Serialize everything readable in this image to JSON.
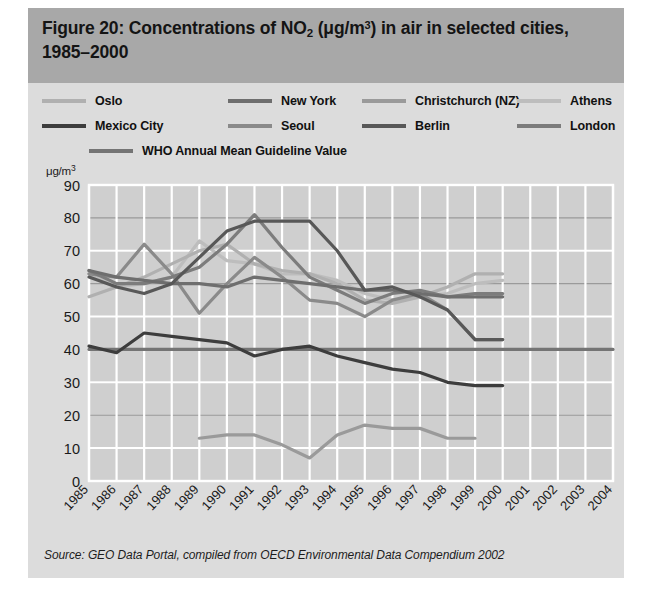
{
  "figure": {
    "title_prefix": "Figure 20: Concentrations of NO",
    "title_sub": "2",
    "title_mid": " (μg/m",
    "title_sup": "3",
    "title_suffix": ") in air in selected cities, 1985–2000",
    "title_plain": "Figure 20: Concentrations of NO2 (μg/m3) in air in selected cities, 1985–2000",
    "source": "Source: GEO Data Portal, compiled from OECD Environmental Data Compendium 2002",
    "y_unit_prefix": "μg/m",
    "y_unit_sup": "3",
    "band_color": "#a8a8a8",
    "panel_color": "#dcdcdc",
    "plot_color": "#cfcfcf"
  },
  "legend": {
    "rows": [
      [
        {
          "label": "Oslo",
          "color": "#b0b0b0",
          "x": 0
        },
        {
          "label": "New York",
          "color": "#6e6e6e",
          "x": 186
        },
        {
          "label": "Christchurch (NZ)",
          "color": "#9a9a9a",
          "x": 320
        },
        {
          "label": "Athens",
          "color": "#bdbdbd",
          "x": 475
        }
      ],
      [
        {
          "label": "Mexico City",
          "color": "#3d3d3d",
          "x": 0
        },
        {
          "label": "Seoul",
          "color": "#8a8a8a",
          "x": 186
        },
        {
          "label": "Berlin",
          "color": "#585858",
          "x": 320
        },
        {
          "label": "London",
          "color": "#7c7c7c",
          "x": 475
        }
      ],
      [
        {
          "label": "WHO Annual Mean Guideline Value",
          "color": "#747474",
          "x": 47
        }
      ]
    ]
  },
  "chart_data": {
    "type": "line",
    "title": "Figure 20: Concentrations of NO2 (μg/m3) in air in selected cities, 1985–2000",
    "xlabel": "",
    "ylabel": "μg/m3",
    "xlim": [
      1985,
      2004
    ],
    "ylim": [
      0,
      90
    ],
    "ytick_step": 10,
    "grid": true,
    "legend_position": "top",
    "x": [
      1985,
      1986,
      1987,
      1988,
      1989,
      1990,
      1991,
      1992,
      1993,
      1994,
      1995,
      1996,
      1997,
      1998,
      1999,
      2000,
      2001,
      2002,
      2003,
      2004
    ],
    "yticks": [
      0,
      10,
      20,
      30,
      40,
      50,
      60,
      70,
      80,
      90
    ],
    "xticklabels": [
      "1985",
      "1986",
      "1987",
      "1988",
      "1989",
      "1990",
      "1991",
      "1992",
      "1993",
      "1994",
      "1995",
      "1996",
      "1997",
      "1998",
      "1999",
      "2000",
      "2001",
      "2002",
      "2003",
      "2004"
    ],
    "series": [
      {
        "name": "Oslo",
        "color": "#b0b0b0",
        "points": [
          [
            1985,
            56
          ],
          [
            1986,
            59
          ],
          [
            1987,
            62
          ],
          [
            1988,
            66
          ],
          [
            1989,
            70
          ],
          [
            1990,
            72
          ],
          [
            1991,
            66
          ],
          [
            1992,
            64
          ],
          [
            1993,
            63
          ],
          [
            1994,
            60
          ],
          [
            1995,
            55
          ],
          [
            1996,
            54
          ],
          [
            1997,
            56
          ],
          [
            1998,
            59
          ],
          [
            1999,
            63
          ],
          [
            2000,
            63
          ]
        ]
      },
      {
        "name": "New York",
        "color": "#6e6e6e",
        "points": [
          [
            1985,
            64
          ],
          [
            1986,
            62
          ],
          [
            1987,
            61
          ],
          [
            1988,
            60
          ],
          [
            1989,
            60
          ],
          [
            1990,
            59
          ],
          [
            1991,
            62
          ],
          [
            1992,
            61
          ],
          [
            1993,
            60
          ],
          [
            1994,
            59
          ],
          [
            1995,
            58
          ],
          [
            1996,
            58
          ],
          [
            1997,
            57
          ],
          [
            1998,
            56
          ],
          [
            1999,
            56
          ],
          [
            2000,
            56
          ]
        ]
      },
      {
        "name": "Christchurch (NZ)",
        "color": "#9a9a9a",
        "points": [
          [
            1989,
            13
          ],
          [
            1990,
            14
          ],
          [
            1991,
            14
          ],
          [
            1992,
            11
          ],
          [
            1993,
            7
          ],
          [
            1994,
            14
          ],
          [
            1995,
            17
          ],
          [
            1996,
            16
          ],
          [
            1997,
            16
          ],
          [
            1998,
            13
          ],
          [
            1999,
            13
          ]
        ]
      },
      {
        "name": "Athens",
        "color": "#bdbdbd",
        "points": [
          [
            1985,
            63
          ],
          [
            1986,
            59
          ],
          [
            1987,
            60
          ],
          [
            1988,
            62
          ],
          [
            1989,
            73
          ],
          [
            1990,
            67
          ],
          [
            1991,
            66
          ],
          [
            1992,
            63
          ],
          [
            1993,
            63
          ],
          [
            1994,
            61
          ],
          [
            1995,
            57
          ],
          [
            1996,
            55
          ],
          [
            1997,
            56
          ],
          [
            1998,
            57
          ],
          [
            1999,
            60
          ],
          [
            2000,
            61
          ]
        ]
      },
      {
        "name": "Mexico City",
        "color": "#3d3d3d",
        "points": [
          [
            1985,
            41
          ],
          [
            1986,
            39
          ],
          [
            1987,
            45
          ],
          [
            1988,
            44
          ],
          [
            1989,
            43
          ],
          [
            1990,
            42
          ],
          [
            1991,
            38
          ],
          [
            1992,
            40
          ],
          [
            1993,
            41
          ],
          [
            1994,
            38
          ],
          [
            1995,
            36
          ],
          [
            1996,
            34
          ],
          [
            1997,
            33
          ],
          [
            1998,
            30
          ],
          [
            1999,
            29
          ],
          [
            2000,
            29
          ]
        ]
      },
      {
        "name": "Seoul",
        "color": "#8a8a8a",
        "points": [
          [
            1985,
            63
          ],
          [
            1986,
            62
          ],
          [
            1987,
            72
          ],
          [
            1988,
            63
          ],
          [
            1989,
            51
          ],
          [
            1990,
            60
          ],
          [
            1991,
            68
          ],
          [
            1992,
            62
          ],
          [
            1993,
            55
          ],
          [
            1994,
            54
          ],
          [
            1995,
            50
          ],
          [
            1996,
            55
          ],
          [
            1997,
            57
          ],
          [
            1998,
            52
          ],
          [
            1999,
            43
          ],
          [
            2000,
            43
          ]
        ]
      },
      {
        "name": "Berlin",
        "color": "#585858",
        "points": [
          [
            1985,
            62
          ],
          [
            1986,
            59
          ],
          [
            1987,
            57
          ],
          [
            1988,
            60
          ],
          [
            1989,
            68
          ],
          [
            1990,
            76
          ],
          [
            1991,
            79
          ],
          [
            1992,
            79
          ],
          [
            1993,
            79
          ],
          [
            1994,
            70
          ],
          [
            1995,
            58
          ],
          [
            1996,
            59
          ],
          [
            1997,
            56
          ],
          [
            1998,
            52
          ],
          [
            1999,
            43
          ],
          [
            2000,
            43
          ]
        ]
      },
      {
        "name": "London",
        "color": "#7c7c7c",
        "points": [
          [
            1985,
            64
          ],
          [
            1986,
            60
          ],
          [
            1987,
            60
          ],
          [
            1988,
            62
          ],
          [
            1989,
            65
          ],
          [
            1990,
            72
          ],
          [
            1991,
            81
          ],
          [
            1992,
            71
          ],
          [
            1993,
            62
          ],
          [
            1994,
            58
          ],
          [
            1995,
            54
          ],
          [
            1996,
            57
          ],
          [
            1997,
            58
          ],
          [
            1998,
            56
          ],
          [
            1999,
            57
          ],
          [
            2000,
            57
          ]
        ]
      },
      {
        "name": "WHO Annual Mean Guideline Value",
        "color": "#747474",
        "points": [
          [
            1985,
            40
          ],
          [
            2004,
            40
          ]
        ]
      }
    ]
  }
}
